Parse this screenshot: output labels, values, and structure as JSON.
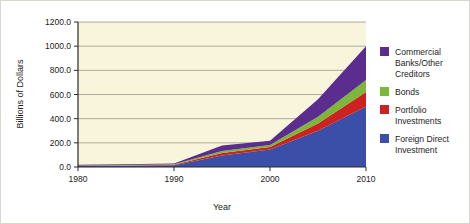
{
  "chart_data": {
    "type": "area",
    "title": "",
    "xlabel": "Year",
    "ylabel": "Billions of Dollars",
    "stacked": true,
    "grid": true,
    "legend_position": "right",
    "x": [
      1980,
      1985,
      1990,
      1995,
      2000,
      2005,
      2010
    ],
    "xlim": [
      1980,
      2010
    ],
    "ylim": [
      0,
      1200
    ],
    "xticks": [
      "1980",
      "1990",
      "2000",
      "2010"
    ],
    "xtick_values": [
      1980,
      1990,
      2000,
      2010
    ],
    "yticks": [
      "0.0",
      "200.0",
      "400.0",
      "600.0",
      "800.0",
      "1000.0",
      "1200.0"
    ],
    "ytick_values": [
      0,
      200,
      400,
      600,
      800,
      1000,
      1200
    ],
    "series": [
      {
        "name": "Foreign Direct Investment",
        "color": "#3b4fa8",
        "values": [
          8,
          10,
          14,
          95,
          145,
          300,
          500
        ]
      },
      {
        "name": "Portfolio Investments",
        "color": "#cc2222",
        "values": [
          2,
          3,
          4,
          20,
          20,
          60,
          120
        ]
      },
      {
        "name": "Bonds",
        "color": "#7cb63a",
        "values": [
          2,
          3,
          4,
          18,
          18,
          55,
          100
        ]
      },
      {
        "name": "Commercial Banks/Other Creditors",
        "color": "#5b2d8e",
        "values": [
          6,
          6,
          8,
          45,
          35,
          145,
          280
        ]
      }
    ],
    "legend_order_top_down": [
      "Commercial Banks/Other Creditors",
      "Bonds",
      "Portfolio Investments",
      "Foreign Direct Investment"
    ]
  },
  "legend": {
    "items": [
      {
        "label_line1": "Commercial",
        "label_line2": "Banks/Other",
        "label_line3": "Creditors",
        "color": "#5b2d8e",
        "name": "commercial-banks"
      },
      {
        "label_line1": "Bonds",
        "label_line2": "",
        "label_line3": "",
        "color": "#7cb63a",
        "name": "bonds"
      },
      {
        "label_line1": "Portfolio",
        "label_line2": "Investments",
        "label_line3": "",
        "color": "#cc2222",
        "name": "portfolio-investments"
      },
      {
        "label_line1": "Foreign Direct",
        "label_line2": "Investment",
        "label_line3": "",
        "color": "#3b4fa8",
        "name": "foreign-direct-investment"
      }
    ]
  },
  "colors": {
    "plot_background": "#f9f5dc",
    "grid": "#8d8d7d",
    "axis": "#2a2a2a",
    "page_background": "#ffffff"
  }
}
